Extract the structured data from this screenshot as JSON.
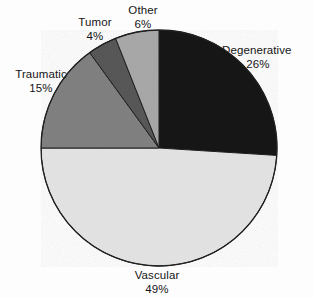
{
  "chart_data": {
    "type": "pie",
    "title": "",
    "subtitle": "",
    "xlabel": "",
    "ylabel": "",
    "legend_position": "none",
    "grid": false,
    "start_angle_deg": 0,
    "direction": "clockwise",
    "categories": [
      "Degenerative",
      "Vascular",
      "Traumatic",
      "Tumor",
      "Other"
    ],
    "values": [
      26,
      49,
      15,
      4,
      6
    ],
    "value_unit": "%",
    "total": 100,
    "slices": [
      {
        "label": "Degenerative",
        "value": 26,
        "value_text": "26%",
        "color": "#151515",
        "start_deg": 0,
        "end_deg": 93.6
      },
      {
        "label": "Vascular",
        "value": 49,
        "value_text": "49%",
        "color": "#e3e3e3",
        "start_deg": 93.6,
        "end_deg": 270.0
      },
      {
        "label": "Traumatic",
        "value": 15,
        "value_text": "15%",
        "color": "#838383",
        "start_deg": 270.0,
        "end_deg": 324.0
      },
      {
        "label": "Tumor",
        "value": 4,
        "value_text": "4%",
        "color": "#5a5a5a",
        "start_deg": 324.0,
        "end_deg": 338.4
      },
      {
        "label": "Other",
        "value": 6,
        "value_text": "6%",
        "color": "#aaaaaa",
        "start_deg": 338.4,
        "end_deg": 360.0
      }
    ]
  },
  "labels": {
    "degenerative": {
      "name": "Degenerative",
      "value": "26%"
    },
    "vascular": {
      "name": "Vascular",
      "value": "49%"
    },
    "traumatic": {
      "name": "Traumatic",
      "value": "15%"
    },
    "tumor": {
      "name": "Tumor",
      "value": "4%"
    },
    "other": {
      "name": "Other",
      "value": "6%"
    }
  },
  "colors": {
    "outline": "#202020",
    "background": "#fdfdfd",
    "text": "#151515"
  }
}
